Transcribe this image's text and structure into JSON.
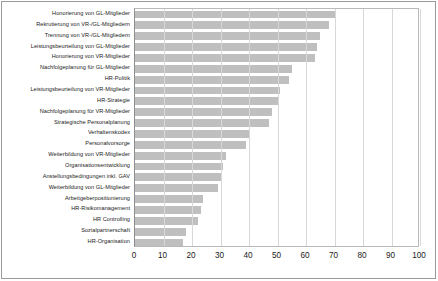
{
  "chart_data": {
    "type": "bar",
    "orientation": "horizontal",
    "title": "",
    "subtitle": "",
    "xlabel": "",
    "ylabel": "",
    "xlim": [
      0,
      100
    ],
    "xticks": [
      "0",
      "10",
      "20",
      "30",
      "40",
      "50",
      "60",
      "70",
      "80",
      "90",
      "100"
    ],
    "xtick_values": [
      0,
      10,
      20,
      30,
      40,
      50,
      60,
      70,
      80,
      90,
      100
    ],
    "grid": true,
    "grid_axis": "x",
    "legend": false,
    "legend_position": "none",
    "bar_color": "#bfbfbf",
    "categories": [
      "Honorierung von GL-Mitglieder",
      "Rekrutierung von VR-/GL-Mitgliedern",
      "Trennung von VR-/GL-Mitgliedern",
      "Leistungsbeurteilung von GL-Mitglieder",
      "Honorierung von VR-Mitglieder",
      "Nachfolgeplanung für GL-Mitglieder",
      "HR-Politik",
      "Leistungsbeurteilung von VR-Mitglieder",
      "HR-Strategie",
      "Nachfolgeplanung für VR-Mitglieder",
      "Strategische Personalplanung",
      "Verhaltenskodex",
      "Personalvorsorge",
      "Weiterbildung von VR-Mitglieder",
      "Organisationsentwicklung",
      "Anstellungsbedingungen inkl. GAV",
      "Weiterbildung von GL-Mitglieder",
      "Arbeitgeberpositionierung",
      "HR-Risikomanagement",
      "HR Controlling",
      "Sozialpartnerschaft",
      "HR-Organisation"
    ],
    "values": [
      70,
      68,
      65,
      64,
      63,
      55,
      54,
      51,
      50,
      48,
      47,
      40,
      39,
      32,
      31,
      30,
      29,
      24,
      23,
      22,
      18,
      17
    ]
  }
}
